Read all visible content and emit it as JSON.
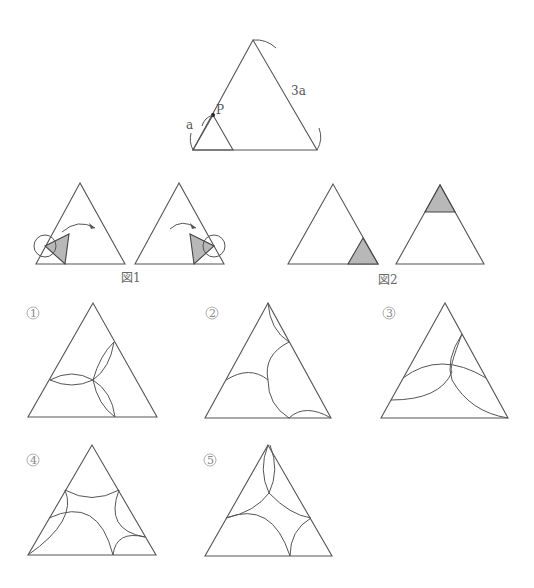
{
  "top_figure": {
    "label_side": "a",
    "label_big": "3a",
    "label_point": "P"
  },
  "figure1": {
    "caption": "図1"
  },
  "figure2": {
    "caption": "図2"
  },
  "options": [
    {
      "id": "①",
      "digit": "1"
    },
    {
      "id": "②",
      "digit": "2"
    },
    {
      "id": "③",
      "digit": "3"
    },
    {
      "id": "④",
      "digit": "4"
    },
    {
      "id": "⑤",
      "digit": "5"
    }
  ],
  "colors": {
    "line": "#555555",
    "shade": "#b8b8b8",
    "background": "#ffffff"
  }
}
